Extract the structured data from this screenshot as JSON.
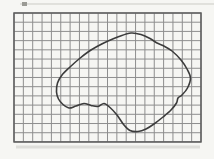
{
  "figure": {
    "width": 214,
    "height": 159,
    "background_color": "#f6f6f3",
    "grid": {
      "x": 14,
      "y": 13,
      "cols": 20,
      "rows": 14,
      "cell_w": 9.35,
      "cell_h": 9.21,
      "line_color": "#8e8e8e",
      "line_width": 1,
      "border_color": "#5d5d5d",
      "border_width": 1.5
    },
    "blob": {
      "stroke_color": "#3c3c3c",
      "stroke_width": 1.6,
      "fill": "none",
      "points": [
        [
          131,
          33
        ],
        [
          141,
          34.5
        ],
        [
          150,
          38.5
        ],
        [
          157,
          43
        ],
        [
          163,
          45.5
        ],
        [
          172,
          51
        ],
        [
          181,
          60
        ],
        [
          187,
          69
        ],
        [
          190.5,
          78
        ],
        [
          187.5,
          88
        ],
        [
          182,
          95
        ],
        [
          178,
          98
        ],
        [
          176.5,
          103
        ],
        [
          171,
          110
        ],
        [
          163,
          117
        ],
        [
          154,
          124
        ],
        [
          146,
          129
        ],
        [
          138,
          131.5
        ],
        [
          130,
          130.5
        ],
        [
          124,
          125
        ],
        [
          117,
          115
        ],
        [
          110,
          107.5
        ],
        [
          104,
          103.5
        ],
        [
          98,
          106.5
        ],
        [
          91,
          105.5
        ],
        [
          84,
          103.5
        ],
        [
          76,
          106
        ],
        [
          69,
          108
        ],
        [
          63,
          104.5
        ],
        [
          58.5,
          99
        ],
        [
          56.5,
          92
        ],
        [
          57.5,
          83
        ],
        [
          62,
          75
        ],
        [
          70,
          67
        ],
        [
          79,
          59
        ],
        [
          88,
          52
        ],
        [
          97,
          46.5
        ],
        [
          108,
          41
        ],
        [
          119,
          36.5
        ]
      ]
    },
    "scan_artifacts": {
      "top_line": {
        "x1": 20,
        "y1": 4,
        "x2": 214,
        "y2": 4,
        "color": "#cbcbc5",
        "width": 1
      },
      "top_tick": {
        "x": 22,
        "y": 2,
        "w": 5,
        "h": 4,
        "color": "#9a9a94"
      },
      "bottom_smudge": {
        "x1": 16,
        "y1": 147,
        "x2": 200,
        "y2": 147,
        "color": "#dededa",
        "width": 3
      }
    }
  }
}
